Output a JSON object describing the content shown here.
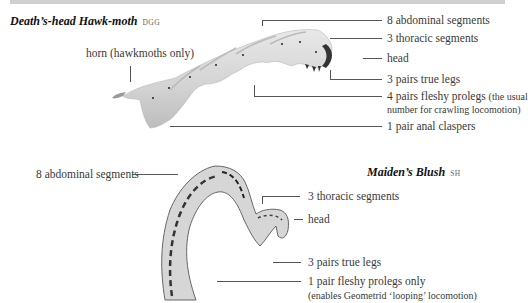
{
  "top_band": {
    "color": "#d0d0d0"
  },
  "hawkmoth": {
    "name": "Death’s-head Hawk-moth",
    "code": "DGG",
    "labels": {
      "horn": "horn (hawkmoths only)",
      "abdominal": "8 abdominal segments",
      "thoracic": "3 thoracic segments",
      "head": "head",
      "true_legs": "3 pairs true legs",
      "prolegs": "4 pairs fleshy prolegs",
      "prolegs_note_1": "(the usual",
      "prolegs_note_2": "number for crawling locomotion)",
      "claspers": "1 pair anal claspers"
    }
  },
  "blush": {
    "name": "Maiden’s Blush",
    "code": "SH",
    "labels": {
      "abdominal": "8 abdominal segments",
      "thoracic": "3 thoracic segments",
      "head": "head",
      "true_legs": "3 pairs true legs",
      "prolegs": "1 pair fleshy prolegs only",
      "prolegs_note": "(enables Geometrid ‘looping’ locomotion)"
    }
  }
}
